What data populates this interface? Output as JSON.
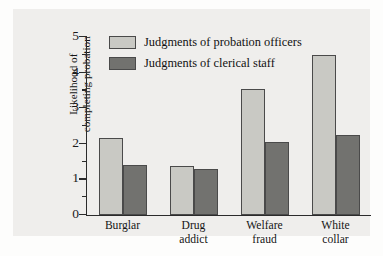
{
  "chart_data": {
    "type": "bar",
    "title": "",
    "xlabel": "",
    "ylabel": "Likelihood of completing probation",
    "ylim": [
      0,
      5
    ],
    "ytick_labels": [
      "0",
      "1",
      "2",
      "3",
      "4",
      "5"
    ],
    "ytick_values": [
      0,
      1,
      2,
      3,
      4,
      5
    ],
    "minor_tick_values": [
      0.5,
      1.5,
      2.5,
      3.5,
      4.5
    ],
    "grid": false,
    "legend_position": "top-left inside",
    "categories": [
      "Burglar",
      "Drug addict",
      "Welfare fraud",
      "White collar"
    ],
    "category_lines": [
      [
        "Burglar"
      ],
      [
        "Drug",
        "addict"
      ],
      [
        "Welfare",
        "fraud"
      ],
      [
        "White",
        "collar"
      ]
    ],
    "series": [
      {
        "name": "Judgments of probation officers",
        "color": "#c9c9c4",
        "values": [
          2.15,
          1.38,
          3.55,
          4.5
        ]
      },
      {
        "name": "Judgments of clerical staff",
        "color": "#72726f",
        "values": [
          1.4,
          1.3,
          2.05,
          2.25
        ]
      }
    ]
  },
  "axis": {
    "y_title_line1": "Likelihood of",
    "y_title_line2": "completing probation"
  },
  "colors": {
    "panel_background": "#efeeec",
    "figure_background": "#fdfdfc",
    "axis": "#2b2b2b",
    "bar_outline": "#4a4a4a",
    "series_light": "#c9c9c4",
    "series_dark": "#72726f"
  }
}
